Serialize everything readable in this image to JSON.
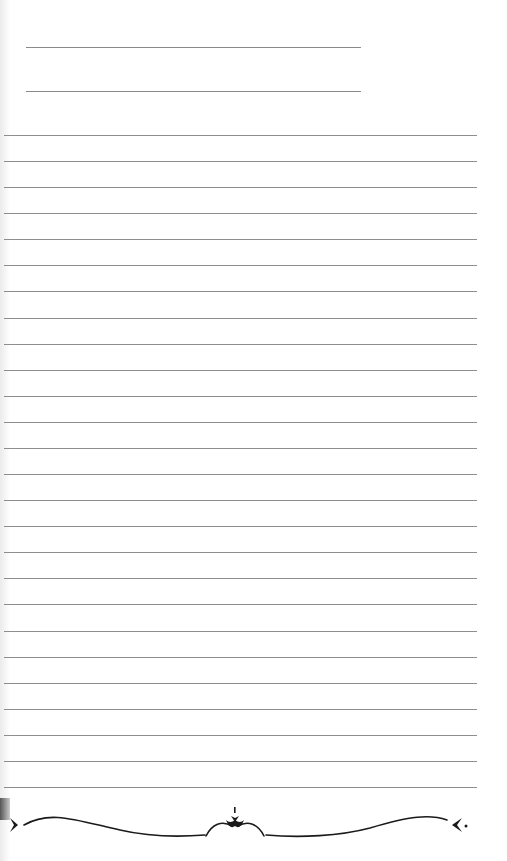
{
  "page": {
    "type": "lined-notebook-page",
    "background": "#ffffff",
    "line_color": "#8e8e8e",
    "header_lines": [
      {
        "y": 47,
        "label": ""
      },
      {
        "y": 91,
        "label": ""
      }
    ],
    "ruled_lines_count": 26,
    "ruled_first_y": 135,
    "ruled_spacing": 26.08,
    "ornament": "decorative-flourish-divider"
  }
}
